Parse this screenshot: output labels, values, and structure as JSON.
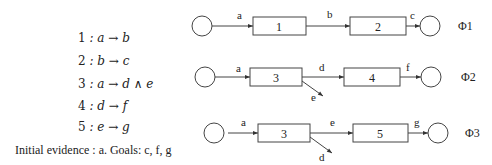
{
  "rules": [
    {
      "num": "1",
      "text": ": a → b"
    },
    {
      "num": "2",
      "text": ": b → c"
    },
    {
      "num": "3",
      "text": ": a → d ∧ e"
    },
    {
      "num": "4",
      "text": ": d → f"
    },
    {
      "num": "5",
      "text": ": e → g"
    }
  ],
  "evidence": "Initial evidence : a. Goals: c, f, g",
  "plans": [
    {
      "label": "Φ1",
      "boxes": [
        "1",
        "2"
      ],
      "edges": [
        "a",
        "b",
        "c"
      ]
    },
    {
      "label": "Φ2",
      "boxes": [
        "3",
        "4"
      ],
      "edges": [
        "a",
        "d",
        "f"
      ],
      "side_edge": "e"
    },
    {
      "label": "Φ3",
      "boxes": [
        "3",
        "5"
      ],
      "edges": [
        "a",
        "e",
        "g"
      ],
      "side_edge": "d"
    }
  ]
}
